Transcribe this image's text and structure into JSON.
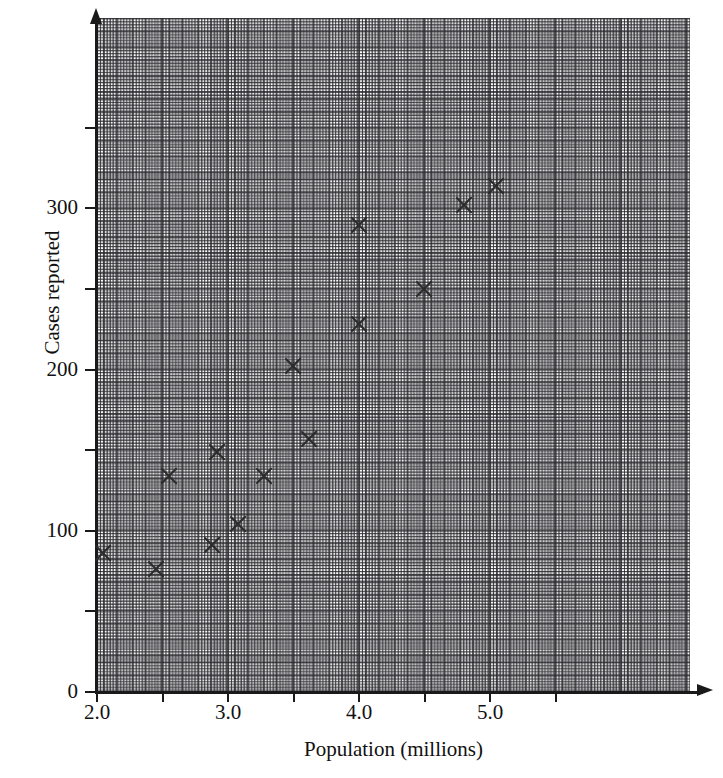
{
  "chart_data": {
    "type": "scatter",
    "title": "",
    "xlabel": "Population (millions)",
    "ylabel": "Cases reported",
    "xlim": [
      2.0,
      5.55
    ],
    "ylim": [
      0,
      418
    ],
    "grid": true,
    "legend": null,
    "x_ticks": [
      {
        "value": 2.0,
        "label": "2.0",
        "major": true
      },
      {
        "value": 2.5,
        "label": "",
        "major": false
      },
      {
        "value": 3.0,
        "label": "3.0",
        "major": true
      },
      {
        "value": 3.5,
        "label": "",
        "major": false
      },
      {
        "value": 4.0,
        "label": "4.0",
        "major": true
      },
      {
        "value": 4.5,
        "label": "",
        "major": false
      },
      {
        "value": 5.0,
        "label": "5.0",
        "major": true
      },
      {
        "value": 5.5,
        "label": "",
        "major": false
      }
    ],
    "y_ticks": [
      {
        "value": 0,
        "label": "0",
        "major": true
      },
      {
        "value": 50,
        "label": "",
        "major": false
      },
      {
        "value": 100,
        "label": "100",
        "major": true
      },
      {
        "value": 150,
        "label": "",
        "major": false
      },
      {
        "value": 200,
        "label": "200",
        "major": true
      },
      {
        "value": 250,
        "label": "",
        "major": false
      },
      {
        "value": 300,
        "label": "300",
        "major": true
      },
      {
        "value": 350,
        "label": "",
        "major": false
      }
    ],
    "marker": "x-cross",
    "marker_color": "#2b2b2b",
    "points": [
      {
        "x": 2.05,
        "y": 86
      },
      {
        "x": 2.45,
        "y": 76
      },
      {
        "x": 2.55,
        "y": 134
      },
      {
        "x": 2.88,
        "y": 91
      },
      {
        "x": 2.92,
        "y": 149
      },
      {
        "x": 3.08,
        "y": 104
      },
      {
        "x": 3.28,
        "y": 134
      },
      {
        "x": 3.5,
        "y": 202
      },
      {
        "x": 3.62,
        "y": 157
      },
      {
        "x": 4.0,
        "y": 228
      },
      {
        "x": 4.0,
        "y": 290
      },
      {
        "x": 4.5,
        "y": 250
      },
      {
        "x": 4.8,
        "y": 302
      },
      {
        "x": 5.05,
        "y": 314
      }
    ]
  },
  "axes": {
    "x_title": "Population (millions)",
    "y_title": "Cases reported"
  }
}
